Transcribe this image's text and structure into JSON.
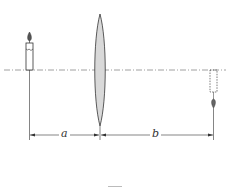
{
  "diagram": {
    "type": "thin-lens-image-formation",
    "object": {
      "name": "candle",
      "position": "left of lens",
      "orientation": "upright"
    },
    "lens": {
      "name": "converging lens",
      "type": "biconvex",
      "fill": "#d9d9d9"
    },
    "image": {
      "name": "image candle",
      "position": "right of lens",
      "orientation": "inverted",
      "style": "dashed"
    },
    "axis": {
      "name": "optical axis",
      "style": "dash-dot"
    },
    "dimensions": {
      "a": {
        "label": "a",
        "from": "object",
        "to": "lens"
      },
      "b": {
        "label": "b",
        "from": "lens",
        "to": "image"
      }
    },
    "colors": {
      "line": "#333333",
      "lens_fill": "#d9d9d9",
      "axis": "#777777"
    }
  }
}
